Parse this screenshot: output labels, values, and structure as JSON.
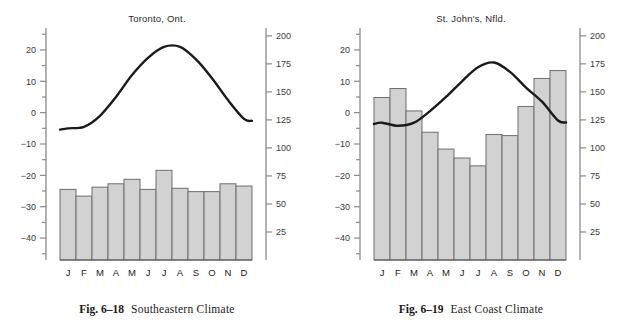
{
  "page": {
    "background": "#ffffff",
    "bar_fill": "#d2d2d2",
    "bar_stroke": "#6e6e6e",
    "curve_color": "#1a1a1a",
    "axis_color": "#8a8a8a"
  },
  "figures": [
    {
      "id": "fig-6-18",
      "figure_number": "Fig. 6–18",
      "caption": "Southeastern Climate",
      "chart_title": "Toronto, Ont."
    },
    {
      "id": "fig-6-19",
      "figure_number": "Fig. 6–19",
      "caption": "East Coast Climate",
      "chart_title": "St. John's, Nfld."
    }
  ],
  "axes": {
    "month_labels": [
      "J",
      "F",
      "M",
      "A",
      "M",
      "J",
      "J",
      "A",
      "S",
      "O",
      "N",
      "D"
    ],
    "left_ticks_major": [
      20,
      10,
      0,
      -10,
      -20,
      -30,
      -40
    ],
    "left_ticks_major_text": [
      "20",
      "10",
      "0",
      "−10",
      "−20",
      "−30",
      "−40"
    ],
    "left_minor_step": 5,
    "left_range": [
      -47,
      27
    ],
    "right_ticks_major": [
      200,
      175,
      150,
      125,
      100,
      75,
      50,
      25
    ],
    "right_ticks_major_text": [
      "200",
      "175",
      "150",
      "125",
      "100",
      "75",
      "50",
      "25"
    ],
    "right_range": [
      0,
      207
    ]
  },
  "chart_data": [
    {
      "type": "bar",
      "title": "Toronto, Ont.",
      "categories": [
        "J",
        "F",
        "M",
        "A",
        "M",
        "J",
        "J",
        "A",
        "S",
        "O",
        "N",
        "D"
      ],
      "xlabel": "",
      "ylabel": "",
      "series": [
        {
          "name": "Precipitation (mm)",
          "kind": "bar",
          "axis": "right",
          "values": [
            63,
            57,
            65,
            68,
            72,
            63,
            80,
            64,
            61,
            61,
            68,
            66
          ],
          "ylim": [
            0,
            207
          ]
        },
        {
          "name": "Temperature (°C)",
          "kind": "line",
          "axis": "left",
          "values": [
            -5,
            -4.5,
            -1,
            5,
            12,
            17.5,
            21,
            21,
            17,
            11,
            4,
            -2
          ],
          "ylim": [
            -47,
            27
          ]
        }
      ],
      "grid": false,
      "legend": "none"
    },
    {
      "type": "bar",
      "title": "St. John's, Nfld.",
      "categories": [
        "J",
        "F",
        "M",
        "A",
        "M",
        "J",
        "J",
        "A",
        "S",
        "O",
        "N",
        "D"
      ],
      "xlabel": "",
      "ylabel": "",
      "series": [
        {
          "name": "Precipitation (mm)",
          "kind": "bar",
          "axis": "right",
          "values": [
            145,
            153,
            133,
            114,
            99,
            91,
            84,
            112,
            111,
            137,
            162,
            169
          ],
          "ylim": [
            0,
            207
          ]
        },
        {
          "name": "Temperature (°C)",
          "kind": "line",
          "axis": "left",
          "values": [
            -3.2,
            -4.2,
            -3.2,
            0.5,
            5,
            10,
            14.5,
            16,
            13,
            8,
            3.5,
            -2.5
          ],
          "ylim": [
            -47,
            27
          ]
        }
      ],
      "grid": false,
      "legend": "none"
    }
  ]
}
